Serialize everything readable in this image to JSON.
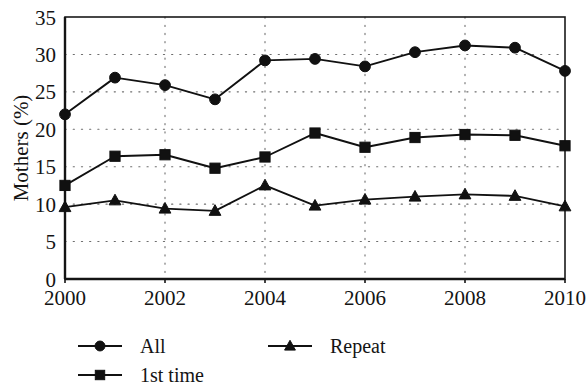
{
  "chart_data": {
    "type": "line",
    "title": "",
    "subtitle": "",
    "xlabel": "",
    "ylabel": "Mothers (%)",
    "x": [
      2000,
      2001,
      2002,
      2003,
      2004,
      2005,
      2006,
      2007,
      2008,
      2009,
      2010
    ],
    "xlim": [
      2000,
      2010
    ],
    "ylim": [
      0,
      35
    ],
    "xticks": [
      "2000",
      "2002",
      "2004",
      "2006",
      "2008",
      "2010"
    ],
    "xtick_values": [
      2000,
      2002,
      2004,
      2006,
      2008,
      2010
    ],
    "yticks": [
      "0",
      "5",
      "10",
      "15",
      "20",
      "25",
      "30",
      "35"
    ],
    "ytick_values": [
      0,
      5,
      10,
      15,
      20,
      25,
      30,
      35
    ],
    "grid": "dotted both axes",
    "legend_position": "below-plot",
    "series": [
      {
        "name": "All",
        "marker": "circle",
        "color": "#111111",
        "values": [
          22.0,
          26.9,
          25.9,
          24.0,
          29.2,
          29.4,
          28.4,
          30.3,
          31.2,
          30.9,
          27.8
        ]
      },
      {
        "name": "1st time",
        "marker": "square",
        "color": "#111111",
        "values": [
          12.5,
          16.4,
          16.6,
          14.8,
          16.3,
          19.5,
          17.6,
          18.9,
          19.3,
          19.2,
          17.8
        ]
      },
      {
        "name": "Repeat",
        "marker": "triangle",
        "color": "#111111",
        "values": [
          9.6,
          10.5,
          9.4,
          9.1,
          12.5,
          9.8,
          10.6,
          11.0,
          11.3,
          11.1,
          9.7
        ]
      }
    ]
  },
  "legend": {
    "items": [
      {
        "label": "All",
        "marker": "circle"
      },
      {
        "label": "1st time",
        "marker": "square"
      },
      {
        "label": "Repeat",
        "marker": "triangle"
      }
    ]
  },
  "axes": {
    "y_title": "Mothers (%)"
  }
}
